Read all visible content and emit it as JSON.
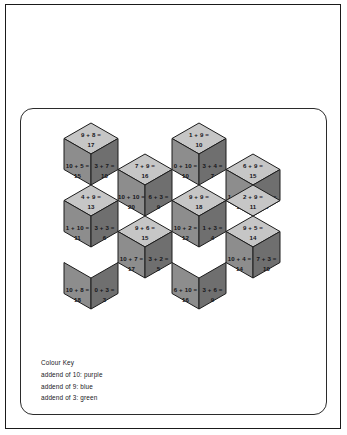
{
  "colour_key": {
    "title": "Colour Key",
    "entries": [
      {
        "label": "addend of 10: purple",
        "addend": 10,
        "colour_name": "purple"
      },
      {
        "label": "addend of 9: blue",
        "addend": 9,
        "colour_name": "blue"
      },
      {
        "label": "addend of 3: green",
        "addend": 3,
        "colour_name": "green"
      }
    ]
  },
  "face_colors": {
    "top": "#c6c6c6",
    "left": "#8d8d8d",
    "right": "#6f6f6f",
    "outline": "#1c1c1c",
    "page_background": "#ffffff",
    "frame": "#1a1a1a"
  },
  "geometry": {
    "cube_half_width": 27,
    "cube_quarter_height": 15.5,
    "unit_note": "isometric cube: top rhombus, left rhombus, right rhombus"
  },
  "cubes": [
    {
      "id": "cube-r1-c1",
      "cx": 70,
      "cy": 45,
      "faces": {
        "top": {
          "expr": "9 + 8 =",
          "answer": "17"
        },
        "left": {
          "expr": "10 + 5 =",
          "answer": "15"
        },
        "right": {
          "expr": "3 + 7 =",
          "answer": "10"
        }
      }
    },
    {
      "id": "cube-r1-c2",
      "cx": 178,
      "cy": 45,
      "faces": {
        "top": {
          "expr": "1 + 9 =",
          "answer": "10"
        },
        "left": {
          "expr": "0 + 10 =",
          "answer": "10"
        },
        "right": {
          "expr": "3 + 4 =",
          "answer": "7"
        }
      }
    },
    {
      "id": "cube-r2-c1",
      "cx": 124,
      "cy": 76,
      "faces": {
        "top": {
          "expr": "7 + 9 =",
          "answer": "16"
        },
        "left": {
          "expr": "10 + 10 =",
          "answer": "20"
        },
        "right": {
          "expr": "6 + 3 =",
          "answer": "9"
        }
      }
    },
    {
      "id": "cube-r2-c2",
      "cx": 232,
      "cy": 76,
      "faces": {
        "top": {
          "expr": "6 + 9 =",
          "answer": "15"
        },
        "left": {
          "expr": "1 + 10 =",
          "answer": "11"
        },
        "right": {
          "expr": "3 + 5 =",
          "answer": "8"
        }
      }
    },
    {
      "id": "cube-r3-c1",
      "cx": 70,
      "cy": 107,
      "faces": {
        "top": {
          "expr": "4 + 9 =",
          "answer": "13"
        },
        "left": {
          "expr": "1 + 10 =",
          "answer": "11"
        },
        "right": {
          "expr": "3 + 3 =",
          "answer": "6"
        }
      }
    },
    {
      "id": "cube-r3-c2",
      "cx": 178,
      "cy": 107,
      "faces": {
        "top": {
          "expr": "9 + 9 =",
          "answer": "18"
        },
        "left": {
          "expr": "10 + 2 =",
          "answer": "12"
        },
        "right": {
          "expr": "1 + 3 =",
          "answer": "4"
        }
      }
    },
    {
      "id": "cube-r4-c1",
      "cx": 124,
      "cy": 138,
      "faces": {
        "top": {
          "expr": "9 + 6 =",
          "answer": "15"
        },
        "left": {
          "expr": "10 + 7 =",
          "answer": "17"
        },
        "right": {
          "expr": "3 + 2 =",
          "answer": "5"
        }
      }
    },
    {
      "id": "cube-r4-c2",
      "cx": 232,
      "cy": 138,
      "faces": {
        "top": {
          "expr": "9 + 5 =",
          "answer": "14"
        },
        "left": {
          "expr": "10 + 4 =",
          "answer": "14"
        },
        "right": {
          "expr": "7 + 3 =",
          "answer": "10"
        }
      }
    },
    {
      "id": "cube-r5-c1",
      "cx": 70,
      "cy": 169,
      "faces": {
        "top": null,
        "left": {
          "expr": "10 + 8 =",
          "answer": "18"
        },
        "right": {
          "expr": "0 + 3 =",
          "answer": "3"
        }
      }
    },
    {
      "id": "cube-r5-c2",
      "cx": 178,
      "cy": 169,
      "faces": {
        "top": null,
        "left": {
          "expr": "6 + 10 =",
          "answer": "16"
        },
        "right": {
          "expr": "3 + 6 =",
          "answer": "9"
        }
      }
    },
    {
      "id": "cube-half-r2-c0",
      "cx": 232,
      "cy": 107,
      "faces": {
        "top": {
          "expr": "2 + 9 =",
          "answer": "11"
        },
        "left": null,
        "right": null
      }
    }
  ]
}
